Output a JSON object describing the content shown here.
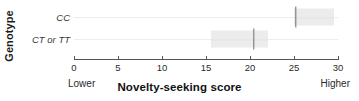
{
  "chart_data": {
    "type": "bar",
    "title": "",
    "xlabel": "Novelty-seeking score",
    "ylabel": "Genotype",
    "xlim": [
      0,
      30
    ],
    "xticks": [
      0,
      5,
      10,
      15,
      20,
      25,
      30
    ],
    "xtick_labels": [
      "0",
      "5",
      "10",
      "15",
      "20",
      "25",
      "30"
    ],
    "grid": true,
    "legend": "none",
    "axis_anchor_low": "Lower",
    "axis_anchor_high": "Higher",
    "categories": [
      "CC",
      "CT or TT"
    ],
    "series": [
      {
        "name": "Novelty-seeking score",
        "points": [
          {
            "category": "CC",
            "estimate": 25.2,
            "ci_low": 25.0,
            "ci_high": 29.5
          },
          {
            "category": "CT or TT",
            "estimate": 20.4,
            "ci_low": 15.6,
            "ci_high": 22.0
          }
        ]
      }
    ],
    "colors": {
      "interval_band": "#ececec",
      "marker": "#6f6f6f",
      "axis": "#555555",
      "gridline": "#ededed",
      "text": "#1a1a1a",
      "background": "#ffffff"
    }
  },
  "axis": {
    "y_title": "Genotype",
    "x_title": "Novelty-seeking score",
    "anchor_low": "Lower",
    "anchor_high": "Higher"
  },
  "rows": [
    {
      "label": "CC"
    },
    {
      "label": "CT or TT"
    }
  ],
  "ticks": [
    {
      "label": "0",
      "value": 0
    },
    {
      "label": "5",
      "value": 5
    },
    {
      "label": "10",
      "value": 10
    },
    {
      "label": "15",
      "value": 15
    },
    {
      "label": "20",
      "value": 20
    },
    {
      "label": "25",
      "value": 25
    },
    {
      "label": "30",
      "value": 30
    }
  ]
}
